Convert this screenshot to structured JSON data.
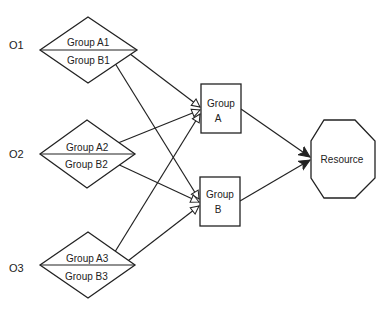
{
  "diagram": {
    "origins": [
      {
        "id": "o1",
        "label": "O1",
        "groups": [
          "Group A1",
          "Group B1"
        ]
      },
      {
        "id": "o2",
        "label": "O2",
        "groups": [
          "Group A2",
          "Group B2"
        ]
      },
      {
        "id": "o3",
        "label": "O3",
        "groups": [
          "Group A3",
          "Group B3"
        ]
      }
    ],
    "groups": [
      {
        "id": "groupA",
        "line1": "Group",
        "line2": "A"
      },
      {
        "id": "groupB",
        "line1": "Group",
        "line2": "B"
      }
    ],
    "resource": {
      "label": "Resource"
    },
    "edges": [
      {
        "from": "Group A1",
        "to": "Group A",
        "arrow": "open"
      },
      {
        "from": "Group B1",
        "to": "Group B",
        "arrow": "open"
      },
      {
        "from": "Group A2",
        "to": "Group A",
        "arrow": "open"
      },
      {
        "from": "Group B2",
        "to": "Group B",
        "arrow": "open"
      },
      {
        "from": "Group A3",
        "to": "Group A",
        "arrow": "open"
      },
      {
        "from": "Group B3",
        "to": "Group B",
        "arrow": "open"
      },
      {
        "from": "Group A",
        "to": "Resource",
        "arrow": "filled"
      },
      {
        "from": "Group B",
        "to": "Resource",
        "arrow": "filled"
      }
    ],
    "colors": {
      "stroke": "#222222",
      "background": "#ffffff"
    }
  }
}
